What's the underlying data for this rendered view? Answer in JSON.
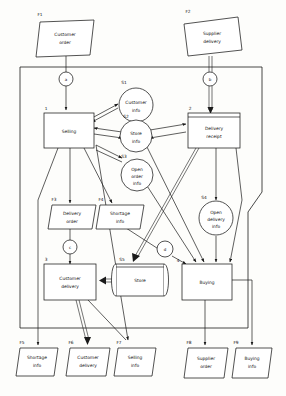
{
  "diagram": {
    "type": "data-flow-diagram",
    "boundary": {
      "name": "system-boundary"
    },
    "processes": [
      {
        "id": "1",
        "label": "Selling"
      },
      {
        "id": "2",
        "label": "Delivery receipt"
      },
      {
        "id": "3",
        "label": "Customer delivery"
      },
      {
        "id": "4",
        "label": "Buying"
      }
    ],
    "datastores": [
      {
        "id": "S1",
        "label": "Customer info",
        "shape": "circle"
      },
      {
        "id": "S2",
        "label": "Store info",
        "shape": "circle"
      },
      {
        "id": "S3",
        "label": "Open order info",
        "shape": "circle"
      },
      {
        "id": "S4",
        "label": "Open delivery info",
        "shape": "circle"
      },
      {
        "id": "S5",
        "label": "Store",
        "shape": "drum"
      }
    ],
    "external_flows": [
      {
        "id": "F1",
        "label": "Customer order"
      },
      {
        "id": "F2",
        "label": "Supplier delivery"
      },
      {
        "id": "F3",
        "label": "Delivery order"
      },
      {
        "id": "F4",
        "label": "Shortage info"
      },
      {
        "id": "F5",
        "label": "Shortage info"
      },
      {
        "id": "F6",
        "label": "Customer delivery"
      },
      {
        "id": "F7",
        "label": "Selling info"
      },
      {
        "id": "F8",
        "label": "Supplier order"
      },
      {
        "id": "F9",
        "label": "Buying info"
      }
    ],
    "connectors": [
      {
        "id": "a"
      },
      {
        "id": "b"
      },
      {
        "id": "c"
      },
      {
        "id": "d"
      }
    ],
    "process_lines": {
      "p1": [
        "Selling"
      ],
      "p2": [
        "Delivery",
        "receipt"
      ],
      "p3": [
        "Customer",
        "delivery"
      ],
      "p4": [
        "Buying"
      ]
    },
    "store_lines": {
      "s1": [
        "Customer",
        "info"
      ],
      "s2": [
        "Store",
        "info"
      ],
      "s3": [
        "Open",
        "order",
        "info"
      ],
      "s4": [
        "Open",
        "delivery",
        "info"
      ],
      "s5": [
        "Store"
      ]
    },
    "flow_lines": {
      "f1": [
        "Customer",
        "order"
      ],
      "f2": [
        "Supplier",
        "delivery"
      ],
      "f3": [
        "Delivery",
        "order"
      ],
      "f4": [
        "Shortage",
        "info"
      ],
      "f5": [
        "Shortage",
        "info"
      ],
      "f6": [
        "Customer",
        "delivery"
      ],
      "f7": [
        "Selling",
        "info"
      ],
      "f8": [
        "Supplier",
        "order"
      ],
      "f9": [
        "Buying",
        "info"
      ]
    },
    "colors": {
      "line": "#1a1a1a",
      "fill": "#ffffff",
      "background": "#fdfdfb"
    }
  }
}
